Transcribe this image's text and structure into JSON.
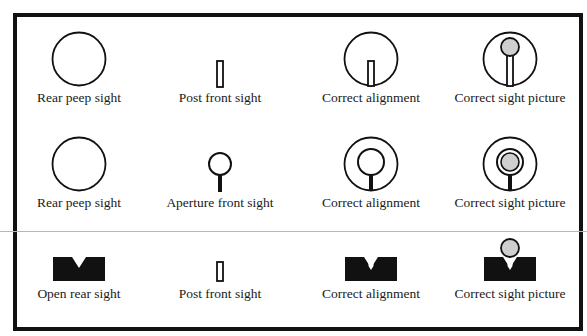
{
  "diagram": {
    "colors": {
      "ink": "#111111",
      "fill_gray": "#cfcfcf",
      "background": "#ffffff",
      "divider": "#b8b8b8"
    },
    "rows": [
      {
        "cells": [
          {
            "label": "Rear peep sight",
            "icon": "rear-peep-sight-icon"
          },
          {
            "label": "Post front sight",
            "icon": "post-front-sight-icon"
          },
          {
            "label": "Correct alignment",
            "icon": "peep-post-alignment-icon"
          },
          {
            "label": "Correct sight picture",
            "icon": "peep-post-sight-picture-icon"
          }
        ]
      },
      {
        "cells": [
          {
            "label": "Rear peep sight",
            "icon": "rear-peep-sight-icon"
          },
          {
            "label": "Aperture front sight",
            "icon": "aperture-front-sight-icon"
          },
          {
            "label": "Correct alignment",
            "icon": "peep-aperture-alignment-icon"
          },
          {
            "label": "Correct sight picture",
            "icon": "peep-aperture-sight-picture-icon"
          }
        ]
      },
      {
        "cells": [
          {
            "label": "Open rear sight",
            "icon": "open-rear-sight-icon"
          },
          {
            "label": "Post front sight",
            "icon": "post-front-sight-icon"
          },
          {
            "label": "Correct alignment",
            "icon": "open-post-alignment-icon"
          },
          {
            "label": "Correct sight picture",
            "icon": "open-post-sight-picture-icon"
          }
        ]
      }
    ]
  }
}
